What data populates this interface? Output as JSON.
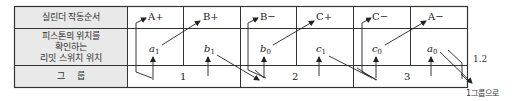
{
  "table": {
    "row_labels": {
      "sequence": "실린더 작동순서",
      "limit_switch": [
        "피스톤의 위치를",
        "확인하는",
        "리밋 스위치 위치"
      ],
      "group": "그    룹"
    },
    "sequence": [
      "A+",
      "B+",
      "B−",
      "C+",
      "C−",
      "A−"
    ],
    "limit_switches": [
      {
        "letter": "a",
        "sub": "1"
      },
      {
        "letter": "b",
        "sub": "1"
      },
      {
        "letter": "b",
        "sub": "0"
      },
      {
        "letter": "c",
        "sub": "1"
      },
      {
        "letter": "c",
        "sub": "0"
      },
      {
        "letter": "a",
        "sub": "0"
      }
    ],
    "groups": [
      "1",
      "2",
      "3"
    ]
  },
  "annotations": {
    "group_transition": "1.2",
    "return_note": "1그룹으로"
  }
}
